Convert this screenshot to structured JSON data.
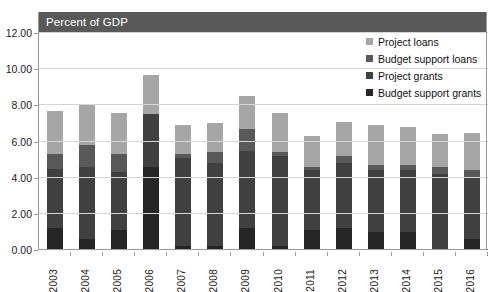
{
  "title": "Percent of GDP",
  "legend": {
    "position": "top-right",
    "items": [
      {
        "label": "Project loans",
        "color": "#a6a6a6"
      },
      {
        "label": "Budget support loans",
        "color": "#595959"
      },
      {
        "label": "Project grants",
        "color": "#404040"
      },
      {
        "label": "Budget support grants",
        "color": "#262626"
      }
    ]
  },
  "axis": {
    "y_ticks": [
      "0.00",
      "2.00",
      "4.00",
      "6.00",
      "8.00",
      "10.00",
      "12.00"
    ],
    "x_ticks": [
      "2003",
      "2004",
      "2005",
      "2006",
      "2007",
      "2008",
      "2009",
      "2010",
      "2011",
      "2012",
      "2013",
      "2014",
      "2015",
      "2016"
    ]
  },
  "chart_data": {
    "type": "bar",
    "stacked": true,
    "title": "Percent of GDP",
    "xlabel": "",
    "ylabel": "",
    "ylim": [
      0,
      12
    ],
    "ytick_step": 2,
    "grid": true,
    "legend_position": "top-right",
    "categories": [
      "2003",
      "2004",
      "2005",
      "2006",
      "2007",
      "2008",
      "2009",
      "2010",
      "2011",
      "2012",
      "2013",
      "2014",
      "2015",
      "2016"
    ],
    "series": [
      {
        "name": "Budget support grants",
        "color": "#262626",
        "values": [
          1.2,
          0.6,
          1.1,
          4.6,
          0.2,
          0.2,
          1.2,
          0.2,
          1.1,
          1.2,
          1.0,
          1.0,
          0.0,
          0.6
        ]
      },
      {
        "name": "Project grants",
        "color": "#404040",
        "values": [
          3.3,
          4.0,
          3.2,
          2.9,
          4.9,
          4.6,
          4.3,
          5.0,
          3.3,
          3.6,
          3.4,
          3.4,
          4.2,
          3.4
        ]
      },
      {
        "name": "Budget support loans",
        "color": "#595959",
        "values": [
          0.8,
          1.2,
          1.0,
          0.0,
          0.2,
          0.6,
          1.2,
          0.2,
          0.2,
          0.4,
          0.3,
          0.3,
          0.4,
          0.4
        ]
      },
      {
        "name": "Project loans",
        "color": "#a6a6a6",
        "values": [
          2.4,
          2.3,
          2.3,
          2.2,
          1.6,
          1.6,
          1.8,
          2.2,
          1.7,
          1.9,
          2.2,
          2.1,
          1.8,
          2.1
        ]
      }
    ],
    "totals": [
      7.7,
      8.1,
      7.6,
      9.7,
      6.9,
      7.0,
      8.5,
      7.6,
      6.3,
      7.1,
      6.9,
      6.8,
      6.4,
      6.5
    ]
  }
}
